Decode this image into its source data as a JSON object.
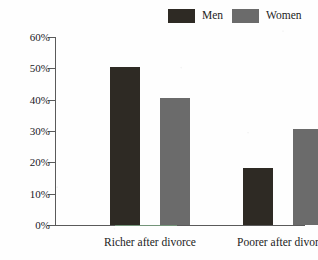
{
  "legend": {
    "entries": [
      {
        "label": "Men",
        "color": "#2e2a24",
        "swatch_name": "legend-swatch-men"
      },
      {
        "label": "Women",
        "color": "#6b6b6b",
        "swatch_name": "legend-swatch-women"
      }
    ]
  },
  "axis": {
    "y_ticks": [
      "0%",
      "10%",
      "20%",
      "30%",
      "40%",
      "50%",
      "60%"
    ],
    "y_tick_values": [
      0,
      10,
      20,
      30,
      40,
      50,
      60
    ]
  },
  "groups": [
    {
      "label": "Richer after divorce"
    },
    {
      "label": "Poorer after divorce"
    }
  ],
  "chart_data": {
    "type": "bar",
    "title": "",
    "subtitle": "",
    "xlabel": "",
    "ylabel": "",
    "categories": [
      "Richer after divorce",
      "Poorer after divorce"
    ],
    "series": [
      {
        "name": "Men",
        "color": "#2e2a24",
        "values": [
          50.3,
          18.3
        ]
      },
      {
        "name": "Women",
        "color": "#6b6b6b",
        "values": [
          40.6,
          30.8
        ]
      }
    ],
    "ylim": [
      0,
      60
    ],
    "ytick_labels": [
      "0%",
      "10%",
      "20%",
      "30%",
      "40%",
      "50%",
      "60%"
    ],
    "ytick_values": [
      0,
      10,
      20,
      30,
      40,
      50,
      60
    ],
    "grid": false,
    "legend_position": "top-right",
    "value_unit": "percent",
    "annotations": []
  }
}
